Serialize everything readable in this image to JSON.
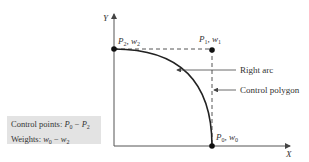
{
  "diagram": {
    "axes": {
      "x_label": "X",
      "y_label": "Y"
    },
    "points": [
      {
        "id": "P0",
        "label_p": "P",
        "label_p_sub": "0",
        "label_w": "w",
        "label_w_sub": "0"
      },
      {
        "id": "P1",
        "label_p": "P",
        "label_p_sub": "1",
        "label_w": "w",
        "label_w_sub": "1"
      },
      {
        "id": "P2",
        "label_p": "P",
        "label_p_sub": "2",
        "label_w": "w",
        "label_w_sub": "2"
      }
    ],
    "callouts": {
      "right_arc": "Right arc",
      "control_polygon": "Control polygon"
    },
    "legend": {
      "line1_prefix": "Control points: ",
      "line1_from": "P",
      "line1_from_sub": "0",
      "line1_sep": " − ",
      "line1_to": "P",
      "line1_to_sub": "2",
      "line2_prefix": "Weights: ",
      "line2_from": "w",
      "line2_from_sub": "0",
      "line2_sep": " − ",
      "line2_to": "w",
      "line2_to_sub": "2"
    }
  }
}
